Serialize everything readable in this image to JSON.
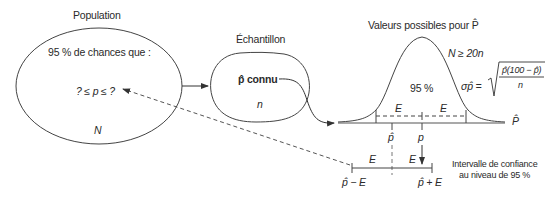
{
  "population": {
    "title": "Population",
    "statement": "95 % de chances que :",
    "inequality": "? ≤ p ≤ ?",
    "size_symbol": "N"
  },
  "sample": {
    "title": "Échantillon",
    "known_label": "p̂ connu",
    "size_symbol": "n"
  },
  "distribution": {
    "title": "Valeurs possibles pour P̂",
    "condition": "N ≥ 20n",
    "center_area": "95 %",
    "sigma_lhs": "σp̂ =",
    "sigma_numerator": "p̂(100 − p̂)",
    "sigma_denominator": "n",
    "axis_label": "P̂",
    "margin_left": "E",
    "margin_right": "E",
    "estimate_tick": "p̂",
    "true_tick": "p"
  },
  "interval": {
    "left_E": "E",
    "right_E": "E",
    "lower_bound": "p̂ − E",
    "upper_bound": "p̂ + E",
    "caption_line1": "Intervalle de confiance",
    "caption_line2": "au niveau de 95 %"
  }
}
